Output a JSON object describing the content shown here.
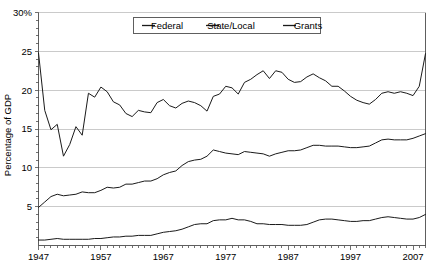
{
  "chart_data": {
    "type": "line",
    "title": "",
    "xlabel": "",
    "ylabel": "Percentage of GDP",
    "xlim": [
      1947,
      2009
    ],
    "ylim": [
      0,
      30
    ],
    "grid": true,
    "legend_position": "top-center",
    "y_ticks": [
      5,
      10,
      15,
      20,
      25,
      30
    ],
    "y_tick_labels": [
      "5",
      "10",
      "15",
      "20",
      "25",
      "30%"
    ],
    "x_ticks": [
      1947,
      1957,
      1967,
      1977,
      1987,
      1997,
      2007
    ],
    "x_tick_labels": [
      "1947",
      "1957",
      "1967",
      "1977",
      "1987",
      "1997",
      "2007"
    ],
    "x_minor_tick_step": 1,
    "x": [
      1947,
      1948,
      1949,
      1950,
      1951,
      1952,
      1953,
      1954,
      1955,
      1956,
      1957,
      1958,
      1959,
      1960,
      1961,
      1962,
      1963,
      1964,
      1965,
      1966,
      1967,
      1968,
      1969,
      1970,
      1971,
      1972,
      1973,
      1974,
      1975,
      1976,
      1977,
      1978,
      1979,
      1980,
      1981,
      1982,
      1983,
      1984,
      1985,
      1986,
      1987,
      1988,
      1989,
      1990,
      1991,
      1992,
      1993,
      1994,
      1995,
      1996,
      1997,
      1998,
      1999,
      2000,
      2001,
      2002,
      2003,
      2004,
      2005,
      2006,
      2007,
      2008,
      2009
    ],
    "series": [
      {
        "name": "Federal",
        "values": [
          24.8,
          17.4,
          14.9,
          15.6,
          11.5,
          13.0,
          15.3,
          14.2,
          19.6,
          19.1,
          20.4,
          19.8,
          18.5,
          18.1,
          17.0,
          16.6,
          17.4,
          17.2,
          17.1,
          18.4,
          18.8,
          18.0,
          17.7,
          18.3,
          18.6,
          18.4,
          18.0,
          17.3,
          19.2,
          19.5,
          20.5,
          20.3,
          19.5,
          21.0,
          21.4,
          22.0,
          22.5,
          21.5,
          22.5,
          22.3,
          21.4,
          21.0,
          21.1,
          21.7,
          22.1,
          21.6,
          21.2,
          20.5,
          20.5,
          19.9,
          19.2,
          18.7,
          18.4,
          18.2,
          18.8,
          19.6,
          19.8,
          19.6,
          19.8,
          19.6,
          19.3,
          20.5,
          24.7
        ]
      },
      {
        "name": "State/Local",
        "values": [
          4.9,
          5.6,
          6.3,
          6.6,
          6.4,
          6.5,
          6.6,
          6.9,
          6.8,
          6.8,
          7.1,
          7.5,
          7.4,
          7.5,
          7.9,
          7.9,
          8.1,
          8.3,
          8.3,
          8.6,
          9.1,
          9.4,
          9.6,
          10.3,
          10.8,
          11.0,
          11.1,
          11.5,
          12.3,
          12.1,
          11.9,
          11.8,
          11.7,
          12.1,
          12.0,
          11.9,
          11.8,
          11.5,
          11.8,
          12.0,
          12.2,
          12.2,
          12.3,
          12.6,
          12.9,
          12.9,
          12.8,
          12.8,
          12.8,
          12.7,
          12.6,
          12.6,
          12.7,
          12.8,
          13.2,
          13.6,
          13.7,
          13.6,
          13.6,
          13.6,
          13.8,
          14.1,
          14.4
        ]
      },
      {
        "name": "Grants",
        "values": [
          0.7,
          0.7,
          0.8,
          0.9,
          0.8,
          0.8,
          0.8,
          0.8,
          0.8,
          0.9,
          0.9,
          1.0,
          1.1,
          1.1,
          1.2,
          1.2,
          1.3,
          1.3,
          1.3,
          1.5,
          1.7,
          1.8,
          1.9,
          2.1,
          2.4,
          2.7,
          2.8,
          2.8,
          3.2,
          3.3,
          3.3,
          3.5,
          3.3,
          3.3,
          3.1,
          2.8,
          2.8,
          2.7,
          2.7,
          2.7,
          2.6,
          2.6,
          2.6,
          2.7,
          3.0,
          3.3,
          3.4,
          3.4,
          3.3,
          3.2,
          3.1,
          3.1,
          3.2,
          3.2,
          3.4,
          3.6,
          3.7,
          3.6,
          3.5,
          3.4,
          3.4,
          3.6,
          4.0
        ]
      }
    ]
  },
  "legend": {
    "items": [
      {
        "label": "Federal"
      },
      {
        "label": "State/Local"
      },
      {
        "label": "Grants"
      }
    ]
  },
  "colors": {
    "line": "#1a1a1a",
    "grid": "#b4b4b4",
    "axis": "#4d4d4d",
    "background": "#ffffff"
  }
}
